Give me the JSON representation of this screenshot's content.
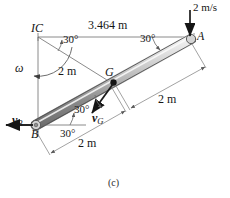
{
  "figure": {
    "caption": "(c)",
    "background_color": "#ffffff",
    "line_color": "#4a4a4a",
    "text_color": "#161616",
    "bar_light": "#e8e8e8",
    "bar_dark": "#808080"
  },
  "points": {
    "A": {
      "label": "A",
      "x": 192,
      "y": 38
    },
    "B": {
      "label": "B",
      "x": 35,
      "y": 125
    },
    "G": {
      "label": "G",
      "x": 113,
      "y": 82
    },
    "IC": {
      "label": "IC",
      "x": 38,
      "y": 37
    }
  },
  "vectors": [
    {
      "name": "velocity-at-A",
      "label": "2 m/s",
      "direction": "down",
      "at": "A"
    },
    {
      "name": "velocity-at-B",
      "label": "v",
      "subscript": "B",
      "direction": "left",
      "at": "B"
    },
    {
      "name": "velocity-at-G",
      "label": "v",
      "subscript": "G",
      "direction": "down-left",
      "at": "G"
    },
    {
      "name": "angular-velocity",
      "label": "ω",
      "direction": "counterclockwise",
      "at": "IC"
    }
  ],
  "dimensions": [
    {
      "name": "ic-to-a-horizontal",
      "label": "3.464 m"
    },
    {
      "name": "ic-to-g",
      "label": "2 m"
    },
    {
      "name": "g-to-a",
      "label": "2 m"
    },
    {
      "name": "b-to-g",
      "label": "2 m"
    }
  ],
  "angles": [
    {
      "name": "angle-at-ic",
      "label": "30°"
    },
    {
      "name": "angle-at-a",
      "label": "30°"
    },
    {
      "name": "angle-at-g",
      "label": "30°"
    },
    {
      "name": "angle-at-b",
      "label": "30°"
    }
  ]
}
